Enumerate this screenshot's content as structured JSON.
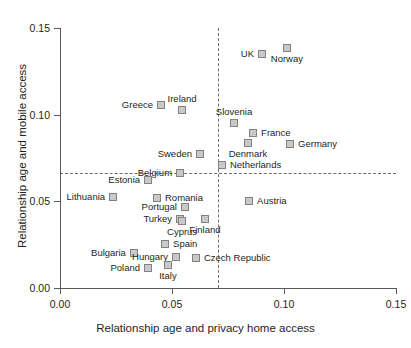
{
  "chart_data": {
    "type": "scatter",
    "title": "",
    "xlabel": "Relationship age and privacy home access",
    "ylabel": "Relationship age and mobile access",
    "xlim": [
      0.0,
      0.15
    ],
    "ylim": [
      0.0,
      0.15
    ],
    "xticks": [
      "0.00",
      "0.05",
      "0.10",
      "0.15"
    ],
    "xtick_values": [
      0.0,
      0.05,
      0.1,
      0.15
    ],
    "yticks": [
      "0.00",
      "0.05",
      "0.10",
      "0.15"
    ],
    "ytick_values": [
      0.0,
      0.05,
      0.1,
      0.15
    ],
    "grid": false,
    "legend": "none",
    "marker_color": "#c9c9c9",
    "marker_edge_color": "#808285",
    "reference_lines": [
      {
        "orientation": "vertical",
        "value": 0.0705,
        "style": "dashed",
        "color": "#6d6e71"
      },
      {
        "orientation": "horizontal",
        "value": 0.0665,
        "style": "dashed",
        "color": "#6d6e71"
      }
    ],
    "points": [
      {
        "label": "UK",
        "x": 0.0902,
        "y": 0.135,
        "lp": "left"
      },
      {
        "label": "Norway",
        "x": 0.1013,
        "y": 0.1385,
        "lp": "below"
      },
      {
        "label": "Greece",
        "x": 0.0451,
        "y": 0.1058,
        "lp": "left"
      },
      {
        "label": "Ireland",
        "x": 0.0545,
        "y": 0.1029,
        "lp": "above"
      },
      {
        "label": "Slovenia",
        "x": 0.0777,
        "y": 0.0952,
        "lp": "above"
      },
      {
        "label": "France",
        "x": 0.0862,
        "y": 0.0894,
        "lp": "right"
      },
      {
        "label": "Germany",
        "x": 0.1027,
        "y": 0.0831,
        "lp": "right"
      },
      {
        "label": "Denmark",
        "x": 0.0839,
        "y": 0.0837,
        "lp": "below"
      },
      {
        "label": "Netherlands",
        "x": 0.0723,
        "y": 0.0712,
        "lp": "right"
      },
      {
        "label": "Sweden",
        "x": 0.0625,
        "y": 0.0775,
        "lp": "left"
      },
      {
        "label": "Belgium",
        "x": 0.0536,
        "y": 0.0665,
        "lp": "left"
      },
      {
        "label": "Estonia",
        "x": 0.0393,
        "y": 0.0625,
        "lp": "left"
      },
      {
        "label": "Lithuania",
        "x": 0.0237,
        "y": 0.0527,
        "lp": "left"
      },
      {
        "label": "Romania",
        "x": 0.0433,
        "y": 0.0521,
        "lp": "right"
      },
      {
        "label": "Portugal",
        "x": 0.0558,
        "y": 0.0469,
        "lp": "left"
      },
      {
        "label": "Turkey",
        "x": 0.0536,
        "y": 0.04,
        "lp": "left"
      },
      {
        "label": "Finland",
        "x": 0.0647,
        "y": 0.04,
        "lp": "below"
      },
      {
        "label": "Cyprus",
        "x": 0.0545,
        "y": 0.0385,
        "lp": "below"
      },
      {
        "label": "Austria",
        "x": 0.0844,
        "y": 0.05,
        "lp": "right"
      },
      {
        "label": "Spain",
        "x": 0.0469,
        "y": 0.0256,
        "lp": "right"
      },
      {
        "label": "Bulgaria",
        "x": 0.033,
        "y": 0.0202,
        "lp": "left"
      },
      {
        "label": "Hungary",
        "x": 0.0518,
        "y": 0.018,
        "lp": "left"
      },
      {
        "label": "Czech Republic",
        "x": 0.0607,
        "y": 0.0175,
        "lp": "right"
      },
      {
        "label": "Poland",
        "x": 0.0393,
        "y": 0.0113,
        "lp": "left"
      },
      {
        "label": "Italy",
        "x": 0.0482,
        "y": 0.0135,
        "lp": "below"
      }
    ]
  }
}
